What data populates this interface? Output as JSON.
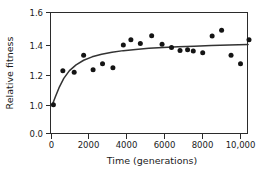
{
  "chart_data": {
    "type": "scatter",
    "title": "",
    "xlabel": "Time (generations)",
    "ylabel": "Relative fitness",
    "xlim": [
      0,
      10600
    ],
    "ylim": [
      0.95,
      1.6
    ],
    "grid": false,
    "legend": null,
    "xticks": [
      0,
      2000,
      4000,
      6000,
      8000,
      10000
    ],
    "xticklabels": [
      "0",
      "2000",
      "4000",
      "6000",
      "8000",
      "10,000"
    ],
    "yticks": [
      0.0,
      1.0,
      1.2,
      1.4,
      1.6
    ],
    "yticklabels": [
      "0.0",
      "1.0",
      "1.2",
      "1.4",
      "1.6"
    ],
    "y_axis_broken": true,
    "y_break_note": "axis breaks between 0.0 and 1.0",
    "marker": "filled-circle",
    "marker_color": "#141414",
    "curve_color": "#333333",
    "series": [
      {
        "name": "Relative fitness",
        "x": [
          100,
          600,
          1200,
          1700,
          2200,
          2700,
          3250,
          3800,
          4200,
          4700,
          5300,
          5850,
          6350,
          6800,
          7200,
          7500,
          8000,
          8500,
          9000,
          9500,
          10000,
          10450
        ],
        "y": [
          1.005,
          1.225,
          1.215,
          1.325,
          1.23,
          1.27,
          1.243,
          1.39,
          1.425,
          1.4,
          1.45,
          1.395,
          1.375,
          1.355,
          1.36,
          1.352,
          1.34,
          1.448,
          1.485,
          1.325,
          1.27,
          1.425
        ]
      }
    ],
    "fit_curve": {
      "name": "hyperbolic fit",
      "model": "w = 1 + a*t/(t + b)",
      "x": [
        60,
        200,
        400,
        650,
        950,
        1300,
        1700,
        2150,
        2650,
        3200,
        3800,
        4450,
        5150,
        5900,
        6700,
        7550,
        8450,
        9400,
        10400
      ],
      "y": [
        1.01,
        1.055,
        1.115,
        1.175,
        1.225,
        1.262,
        1.292,
        1.314,
        1.331,
        1.344,
        1.354,
        1.362,
        1.369,
        1.374,
        1.379,
        1.383,
        1.387,
        1.39,
        1.393
      ]
    }
  }
}
